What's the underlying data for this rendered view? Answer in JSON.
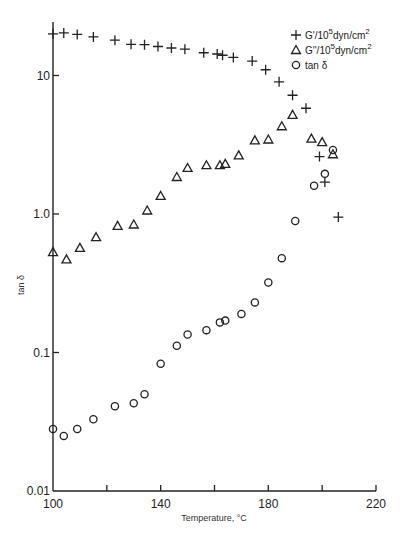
{
  "chart_data": {
    "type": "scatter",
    "title": "",
    "xlabel": "Temperature, °C",
    "ylabel": "tan δ",
    "xlim": [
      100,
      220
    ],
    "ylim": [
      0.01,
      24
    ],
    "yscale": "log",
    "x_ticks": [
      100,
      120,
      140,
      160,
      180,
      200,
      220
    ],
    "x_tick_labels": [
      "100",
      "",
      "140",
      "",
      "180",
      "",
      "220"
    ],
    "y_ticks": [
      0.01,
      0.1,
      1.0,
      10
    ],
    "y_tick_labels": [
      "0.01",
      "0.1",
      "1.0",
      "10"
    ],
    "grid": false,
    "legend_position": "upper right",
    "series": [
      {
        "name": "G'/10^5 dyn/cm^2",
        "legend_label": "G'/10",
        "legend_sup": "5",
        "legend_unit": "dyn/cm",
        "legend_unit_sup": "2",
        "marker": "plus",
        "points": [
          [
            100,
            20.0
          ],
          [
            104,
            20.3
          ],
          [
            109,
            19.8
          ],
          [
            115,
            19.0
          ],
          [
            123,
            18.0
          ],
          [
            129,
            16.8
          ],
          [
            134,
            16.7
          ],
          [
            139,
            16.2
          ],
          [
            144,
            15.8
          ],
          [
            149,
            15.5
          ],
          [
            156,
            14.6
          ],
          [
            161,
            14.3
          ],
          [
            163,
            14.0
          ],
          [
            167,
            13.5
          ],
          [
            174,
            12.7
          ],
          [
            179,
            11.0
          ],
          [
            184,
            9.0
          ],
          [
            189,
            7.2
          ],
          [
            194,
            5.8
          ],
          [
            199,
            2.6
          ],
          [
            201,
            1.7
          ],
          [
            206,
            0.95
          ]
        ]
      },
      {
        "name": "G''/10^5 dyn/cm^2",
        "legend_label": "G''/10",
        "legend_sup": "5",
        "legend_unit": "dyn/cm",
        "legend_unit_sup": "2",
        "marker": "triangle",
        "points": [
          [
            100,
            0.53
          ],
          [
            105,
            0.47
          ],
          [
            110,
            0.57
          ],
          [
            116,
            0.68
          ],
          [
            124,
            0.82
          ],
          [
            130,
            0.84
          ],
          [
            135,
            1.06
          ],
          [
            140,
            1.35
          ],
          [
            146,
            1.85
          ],
          [
            150,
            2.15
          ],
          [
            157,
            2.25
          ],
          [
            162,
            2.25
          ],
          [
            164,
            2.3
          ],
          [
            169,
            2.65
          ],
          [
            175,
            3.4
          ],
          [
            180,
            3.45
          ],
          [
            185,
            4.3
          ],
          [
            189,
            5.2
          ],
          [
            196,
            3.5
          ],
          [
            200,
            3.3
          ],
          [
            204,
            2.7
          ]
        ]
      },
      {
        "name": "tan δ",
        "legend_label": "tan δ",
        "marker": "circle",
        "points": [
          [
            100,
            0.028
          ],
          [
            104,
            0.025
          ],
          [
            109,
            0.028
          ],
          [
            115,
            0.033
          ],
          [
            123,
            0.041
          ],
          [
            130,
            0.043
          ],
          [
            134,
            0.05
          ],
          [
            140,
            0.083
          ],
          [
            146,
            0.112
          ],
          [
            150,
            0.135
          ],
          [
            157,
            0.145
          ],
          [
            162,
            0.165
          ],
          [
            164,
            0.17
          ],
          [
            170,
            0.19
          ],
          [
            175,
            0.23
          ],
          [
            180,
            0.32
          ],
          [
            185,
            0.48
          ],
          [
            190,
            0.89
          ],
          [
            197,
            1.6
          ],
          [
            201,
            1.95
          ],
          [
            204,
            2.9
          ]
        ]
      }
    ]
  }
}
